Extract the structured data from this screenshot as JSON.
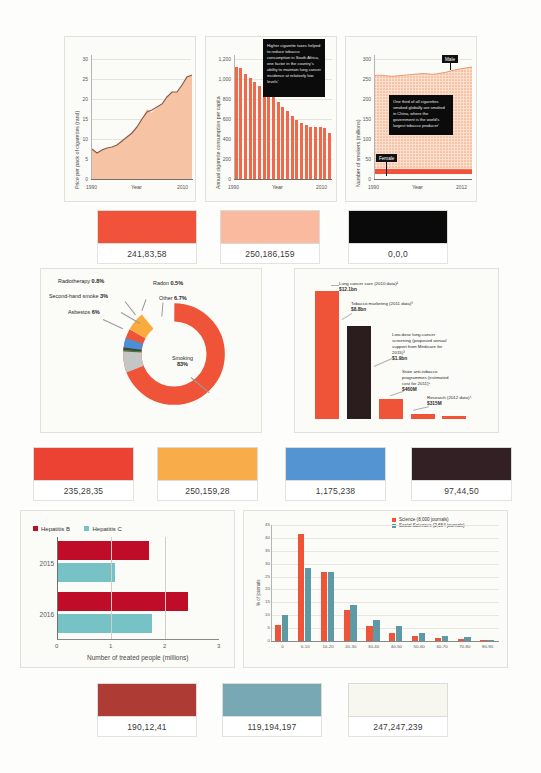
{
  "charts": {
    "price_line": {
      "ylabel": "Price per pack of cigarettes (rand)",
      "xlabel": "Year",
      "yticks": [
        "0",
        "5",
        "10",
        "15",
        "20",
        "25",
        "30"
      ],
      "xticks": [
        "1990",
        "2010"
      ],
      "type": "area",
      "ylim": [
        0,
        30
      ],
      "xlim": [
        1990,
        2010
      ],
      "x": [
        1990,
        1991,
        1992,
        1993,
        1994,
        1995,
        1996,
        1997,
        1998,
        1999,
        2000,
        2001,
        2002,
        2003,
        2004,
        2005,
        2006,
        2007,
        2008,
        2009,
        2010
      ],
      "values": [
        7.2,
        6.6,
        7.0,
        7.4,
        7.6,
        8.0,
        8.6,
        9.6,
        10.4,
        11.8,
        13.4,
        15.2,
        16.2,
        16.8,
        17.2,
        18.4,
        19.6,
        20.4,
        20.4,
        21.6,
        23.4
      ]
    },
    "consumption_bars": {
      "ylabel": "Annual cigarette consumption per capita",
      "xlabel": "Year",
      "yticks": [
        "0",
        "200",
        "400",
        "600",
        "800",
        "1,000",
        "1,200"
      ],
      "xticks": [
        "1990",
        "2010"
      ],
      "type": "bar",
      "ylim": [
        0,
        1200
      ],
      "categories": [
        "1990",
        "1991",
        "1992",
        "1993",
        "1994",
        "1995",
        "1996",
        "1997",
        "1998",
        "1999",
        "2000",
        "2001",
        "2002",
        "2003",
        "2004",
        "2005",
        "2006",
        "2007",
        "2008",
        "2009",
        "2010"
      ],
      "values": [
        1085,
        1070,
        1015,
        975,
        940,
        900,
        870,
        830,
        790,
        745,
        700,
        655,
        610,
        575,
        545,
        520,
        505,
        500,
        505,
        490,
        445
      ],
      "callout": "Higher cigarette taxes helped to reduce tobacco consumption in South Africa, one factor in the country's ability to maintain lung cancer incidence at relatively low levels'"
    },
    "smokers_area": {
      "ylabel": "Number of smokers (millions)",
      "xlabel": "Year",
      "yticks": [
        "0",
        "50",
        "100",
        "150",
        "200",
        "250",
        "300"
      ],
      "xticks": [
        "1990",
        "2012"
      ],
      "type": "area",
      "ylim": [
        0,
        300
      ],
      "series": [
        {
          "name": "Male",
          "values": [
            252,
            253,
            252,
            251,
            250,
            251,
            252,
            253,
            254,
            255,
            256,
            257,
            256,
            255,
            256,
            258,
            260,
            263,
            266,
            268,
            270,
            272,
            273
          ]
        },
        {
          "name": "Female",
          "values": [
            12,
            12,
            12,
            12,
            12,
            11,
            11,
            11,
            11,
            11,
            11,
            11,
            11,
            11,
            11,
            11,
            11,
            11,
            11,
            11,
            11,
            11,
            11
          ]
        }
      ],
      "label_male": "Male",
      "label_female": "Female",
      "callout": "One third of all cigarettes smoked globally are smoked in China, where the government is the world's largest tobacco producer'"
    },
    "causes_donut": {
      "type": "pie",
      "title": "Causes of lung cancer",
      "slices": [
        {
          "label": "Smoking",
          "value": 83,
          "display": "83%",
          "color": "#ef5338"
        },
        {
          "label": "Asbestos",
          "value": 6,
          "display": "6%",
          "color": "#fbab3e"
        },
        {
          "label": "Second-hand smoke",
          "value": 3,
          "display": "3%",
          "color": "#4a90d9"
        },
        {
          "label": "Radiotherapy",
          "value": 0.8,
          "display": "0.8%",
          "color": "#2f4f3a"
        },
        {
          "label": "Radon",
          "value": 0.5,
          "display": "0.5%",
          "color": "#3a7a4a"
        },
        {
          "label": "Other",
          "value": 6.7,
          "display": "6.7%",
          "color": "#c3c6c5"
        }
      ]
    },
    "spending_bars": {
      "type": "bar",
      "categories": [
        "Lung cancer care (2010 data)²",
        "Tobacco marketing (2011 data)³",
        "Low-dose lung-cancer screening (proposed annual support from Medicare for 2015)³",
        "State anti-tobacco programmes (estimated cost for 2011)⁵",
        "Research (2012 data)⁴"
      ],
      "labels_short": [
        "Lung cancer care (2010 data)²",
        "Tobacco marketing (2011 data)³",
        "Low-dose lung-cancer screening (proposed annual support from Medicare for 2015)³",
        "State anti-tobacco programmes (estimated cost for 2011)⁵",
        "Research (2012 data)⁴"
      ],
      "values": [
        12.1,
        8.8,
        1.9,
        0.46,
        0.315
      ],
      "display_values": [
        "$12.1bn",
        "$8.8bn",
        "$1.9bn",
        "$460M",
        "$315M"
      ],
      "ylabel": "",
      "ylim": [
        0,
        13
      ]
    },
    "hepatitis": {
      "type": "bar",
      "orientation": "horizontal",
      "xlabel": "Number of treated people (millions)",
      "xticks": [
        "0",
        "1",
        "2",
        "3"
      ],
      "xlim": [
        0,
        3
      ],
      "groups": [
        "2015",
        "2016"
      ],
      "series": [
        {
          "name": "Hepatitis B",
          "color": "#be0c29",
          "values": [
            1.7,
            2.42
          ]
        },
        {
          "name": "Hepatitis C",
          "color": "#77c2c5",
          "values": [
            1.07,
            1.76
          ]
        }
      ]
    },
    "journals": {
      "type": "bar",
      "ylabel": "% of journals",
      "ylim": [
        0,
        45
      ],
      "yticks": [
        "0",
        "5",
        "10",
        "15",
        "20",
        "25",
        "30",
        "35",
        "40",
        "45"
      ],
      "categories": [
        "0",
        "0-10",
        "10-20",
        "20-30",
        "30-40",
        "40-50",
        "50-60",
        "60-70",
        "70-80",
        "80-90"
      ],
      "series": [
        {
          "name": "Science (8,000 journals)",
          "color": "#ef5338",
          "values": [
            6.2,
            41.7,
            26.9,
            11.9,
            6.0,
            3.1,
            2.1,
            1.0,
            0.7,
            0.2
          ]
        },
        {
          "name": "Social Sciences (2,664 journals)",
          "color": "#5e9aa5",
          "values": [
            10.0,
            28.2,
            26.9,
            13.8,
            8.3,
            5.7,
            3.1,
            1.8,
            1.4,
            0.3
          ]
        }
      ]
    }
  },
  "swatch_rows": [
    {
      "items": [
        {
          "label": "241,83,58",
          "color": "#f1533a"
        },
        {
          "label": "250,186,159",
          "color": "#fabaa0"
        },
        {
          "label": "0,0,0",
          "color": "#000000"
        }
      ]
    },
    {
      "items": [
        {
          "label": "235,28,35",
          "color": "#eb1c23"
        },
        {
          "label": "250,159,28",
          "color": "#fa9f1c"
        },
        {
          "label": "1,175,238",
          "color": "#01afee"
        },
        {
          "label": "97,44,50",
          "color": "#612c32"
        }
      ]
    },
    {
      "items": [
        {
          "label": "190,12,41",
          "color": "#be0c29"
        },
        {
          "label": "119,194,197",
          "color": "#77c2c5"
        },
        {
          "label": "247,247,239",
          "color": "#f7f7ef"
        }
      ]
    }
  ]
}
